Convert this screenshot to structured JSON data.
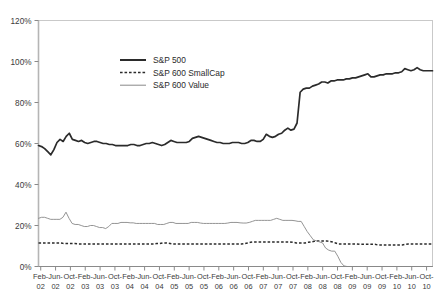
{
  "chart_data": {
    "type": "line",
    "title": "",
    "subtitle": "",
    "xlabel": "",
    "ylabel": "",
    "ylim": [
      0,
      120
    ],
    "ytick_labels": [
      "0%",
      "20%",
      "40%",
      "60%",
      "80%",
      "100%",
      "120%"
    ],
    "ytick_values": [
      0,
      20,
      40,
      60,
      80,
      100,
      120
    ],
    "grid": false,
    "legend_position": "upper-center",
    "x_tick_months": [
      "Feb",
      "Jun",
      "Oct",
      "Feb",
      "Jun",
      "Oct",
      "Feb",
      "Jun",
      "Oct",
      "Feb",
      "Jun",
      "Oct",
      "Feb",
      "Jun",
      "Oct",
      "Feb",
      "Jun",
      "Oct",
      "Feb",
      "Jun",
      "Oct",
      "Feb",
      "Jun",
      "Oct",
      "Feb",
      "Jun",
      "Oct"
    ],
    "x_tick_years": [
      "02",
      "02",
      "02",
      "03",
      "03",
      "03",
      "04",
      "04",
      "04",
      "05",
      "05",
      "05",
      "06",
      "06",
      "06",
      "07",
      "07",
      "07",
      "08",
      "08",
      "08",
      "09",
      "09",
      "09",
      "10",
      "10",
      "10"
    ],
    "x_range_label": "Feb-02 to Oct-10",
    "series": [
      {
        "name": "S&P 500",
        "style": "solid-thick",
        "color": "#2b2b2b",
        "values": [
          59,
          58.5,
          57.5,
          56,
          54.5,
          57,
          60.5,
          62,
          61,
          63.5,
          65,
          62,
          61.5,
          61,
          61.5,
          60.5,
          60,
          60.5,
          61,
          61,
          60.5,
          60,
          60,
          59.5,
          59.5,
          59,
          59,
          59,
          59,
          59,
          59.5,
          59.5,
          59,
          59,
          59.5,
          60,
          60,
          60.5,
          60,
          59.5,
          59,
          59.5,
          60.5,
          61.5,
          61,
          60.5,
          60.5,
          60.5,
          60.5,
          61,
          62.5,
          63,
          63.5,
          63,
          62.5,
          62,
          61.5,
          61,
          60.5,
          60.5,
          60,
          60,
          60,
          60.5,
          60.5,
          60.5,
          60,
          60,
          60.5,
          61.5,
          61.5,
          61,
          61,
          62,
          64.5,
          63.5,
          63,
          63.5,
          64.5,
          65,
          66.5,
          67.5,
          66.5,
          67,
          70,
          85,
          86.5,
          87,
          87,
          88,
          88.5,
          89,
          90,
          90,
          89.5,
          90.5,
          90.5,
          91,
          91,
          91,
          91.5,
          91.5,
          92,
          92,
          92.5,
          93,
          93.5,
          94,
          92.5,
          92.5,
          93,
          93.5,
          93.5,
          94,
          94,
          94,
          94.5,
          94.5,
          95,
          96.5,
          96,
          95.5,
          96,
          97,
          96,
          95.5,
          95.5,
          95.5,
          95.5
        ]
      },
      {
        "name": "S&P 600 SmallCap",
        "style": "dotted",
        "color": "#2b2b2b",
        "values": [
          11.5,
          11.5,
          11.5,
          11.5,
          11.5,
          11.5,
          11.5,
          11.5,
          11.3,
          11.2,
          11.2,
          11.2,
          11.2,
          11,
          11,
          11,
          11,
          11,
          11,
          11,
          11,
          11,
          11,
          11,
          11,
          11,
          11,
          11,
          11,
          11,
          11,
          11,
          11,
          11,
          11,
          11,
          11,
          11,
          11,
          11.2,
          11.2,
          11.5,
          11.5,
          11.3,
          11,
          11,
          11,
          11,
          11,
          11,
          11,
          11,
          11,
          11,
          11,
          11,
          11,
          11,
          11,
          11,
          11,
          11,
          11,
          11,
          11,
          11,
          11,
          11,
          11.2,
          11.5,
          11.8,
          12,
          12,
          12,
          12,
          12,
          12,
          12,
          12,
          12,
          12,
          12,
          12,
          12,
          11.8,
          11.5,
          11.5,
          11.5,
          11.5,
          11.8,
          12,
          12.3,
          12.5,
          12.5,
          12.5,
          12.5,
          12.3,
          12,
          11.5,
          11,
          11,
          11,
          11,
          11,
          11,
          11,
          10.8,
          10.8,
          10.8,
          10.8,
          10.8,
          10.8,
          10.5,
          10.5,
          10.5,
          10.5,
          10.5,
          10.5,
          10.5,
          10.5,
          10.5,
          10.8,
          11,
          11,
          11,
          11,
          11,
          11,
          11,
          11,
          11
        ]
      },
      {
        "name": "S&P 600 Value",
        "style": "solid-thin",
        "color": "#888888",
        "values": [
          23.5,
          24,
          24,
          23.5,
          23,
          23,
          23,
          23,
          24,
          26.5,
          23.5,
          21,
          20.5,
          20.5,
          20,
          19.5,
          19.5,
          20,
          20,
          19.5,
          19,
          19,
          18.5,
          19.5,
          21,
          21,
          21,
          21.5,
          21.5,
          21.5,
          21.3,
          21.3,
          21,
          21,
          21,
          21,
          21,
          21,
          21,
          20.5,
          20.5,
          20.5,
          21,
          21.5,
          21.5,
          21,
          21,
          21,
          21,
          21,
          21.5,
          21.5,
          21.5,
          21.2,
          21,
          21,
          21,
          21,
          21,
          21,
          21,
          21,
          21.2,
          21.5,
          21.5,
          21.5,
          21.3,
          21.2,
          21.2,
          21.5,
          22,
          22.5,
          22.5,
          22.5,
          22.5,
          22.5,
          22.5,
          23,
          23.5,
          23,
          22.5,
          22.5,
          22.5,
          22.5,
          22.3,
          22,
          22,
          19.5,
          17,
          15,
          13,
          12.5,
          12,
          11.5,
          9,
          8,
          7.5,
          7.5,
          5,
          2,
          0.3,
          0,
          0,
          0,
          0,
          0,
          0,
          0,
          0,
          0,
          0,
          0,
          0,
          0,
          0,
          0,
          0,
          0,
          0,
          0,
          0,
          0,
          0,
          0,
          0,
          0,
          0,
          0,
          0,
          0
        ]
      }
    ]
  },
  "legend": {
    "items": [
      {
        "label": "S&P 500"
      },
      {
        "label": "S&P 600 SmallCap"
      },
      {
        "label": "S&P 600 Value"
      }
    ]
  }
}
